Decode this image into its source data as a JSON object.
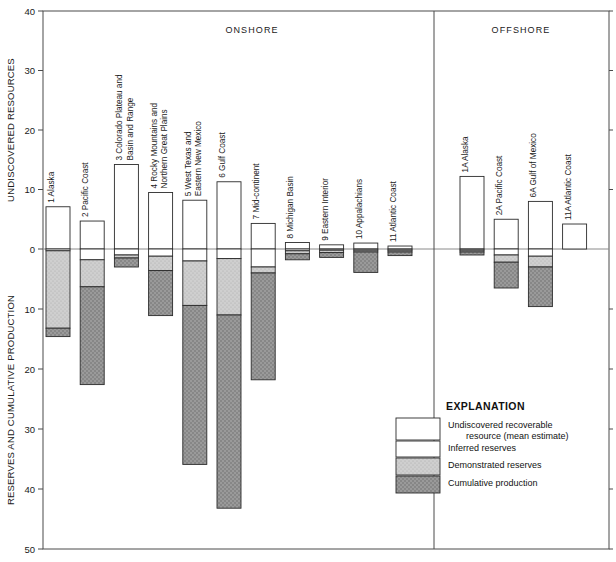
{
  "chart_data": {
    "type": "bar",
    "title": "",
    "ylabel_top": "UNDISCOVERED RESOURCES",
    "ylabel_bottom": "RESERVES AND CUMULATIVE PRODUCTION",
    "xlabel": "",
    "ylim": [
      -50,
      40
    ],
    "yticks_top": [
      40,
      30,
      20,
      10,
      0
    ],
    "yticks_bottom": [
      0,
      10,
      20,
      30,
      40,
      50
    ],
    "grid": false,
    "legend_position": "inside-lower-right",
    "group_labels": [
      "ONSHORE",
      "OFFSHORE"
    ],
    "series": [
      {
        "name": "Undiscovered recoverable resource (mean estimate)",
        "key": "undiscovered",
        "color": "#ffffff"
      },
      {
        "name": "Inferred reserves",
        "key": "inferred",
        "color": "#fdfdfd"
      },
      {
        "name": "Demonstrated reserves",
        "key": "demonstrated",
        "color": "#c8c8c8"
      },
      {
        "name": "Cumulative production",
        "key": "cumulative",
        "color": "#8f8f8f"
      }
    ],
    "categories": [
      {
        "id": "1",
        "label": "1 Alaska",
        "group": "ONSHORE",
        "undiscovered": 7.1,
        "inferred": 0.3,
        "demonstrated": 13.2,
        "cumulative": 14.6
      },
      {
        "id": "2",
        "label": "2 Pacific Coast",
        "group": "ONSHORE",
        "undiscovered": 4.7,
        "inferred": 1.8,
        "demonstrated": 6.3,
        "cumulative": 22.6
      },
      {
        "id": "3",
        "label": "3 Colorado Plateau and\nBasin and Range",
        "group": "ONSHORE",
        "undiscovered": 14.2,
        "inferred": 1.0,
        "demonstrated": 1.5,
        "cumulative": 3.0
      },
      {
        "id": "4",
        "label": "4 Rocky Mountains and\nNorthern Great Plains",
        "group": "ONSHORE",
        "undiscovered": 9.5,
        "inferred": 1.2,
        "demonstrated": 3.6,
        "cumulative": 11.1
      },
      {
        "id": "5",
        "label": "5 West Texas and\nEastern New Mexico",
        "group": "ONSHORE",
        "undiscovered": 8.2,
        "inferred": 2.0,
        "demonstrated": 9.4,
        "cumulative": 35.9
      },
      {
        "id": "6",
        "label": "6 Gulf Coast",
        "group": "ONSHORE",
        "undiscovered": 11.3,
        "inferred": 1.6,
        "demonstrated": 11.0,
        "cumulative": 43.2
      },
      {
        "id": "7",
        "label": "7 Mid-continent",
        "group": "ONSHORE",
        "undiscovered": 4.3,
        "inferred": 3.0,
        "demonstrated": 4.0,
        "cumulative": 21.8
      },
      {
        "id": "8",
        "label": "8 Michigan Basin",
        "group": "ONSHORE",
        "undiscovered": 1.1,
        "inferred": 0.3,
        "demonstrated": 0.8,
        "cumulative": 1.8
      },
      {
        "id": "9",
        "label": "9 Eastern Interior",
        "group": "ONSHORE",
        "undiscovered": 0.7,
        "inferred": 0.2,
        "demonstrated": 0.6,
        "cumulative": 1.4
      },
      {
        "id": "10",
        "label": "10 Appalachians",
        "group": "ONSHORE",
        "undiscovered": 1.0,
        "inferred": 0.2,
        "demonstrated": 0.5,
        "cumulative": 3.9
      },
      {
        "id": "11",
        "label": "11 Atlantic Coast",
        "group": "ONSHORE",
        "undiscovered": 0.5,
        "inferred": 0.2,
        "demonstrated": 0.5,
        "cumulative": 1.1
      },
      {
        "id": "1A",
        "label": "1A Alaska",
        "group": "OFFSHORE",
        "undiscovered": 12.2,
        "inferred": 0.2,
        "demonstrated": 0.5,
        "cumulative": 1.0
      },
      {
        "id": "2A",
        "label": "2A Pacific Coast",
        "group": "OFFSHORE",
        "undiscovered": 5.0,
        "inferred": 1.0,
        "demonstrated": 2.2,
        "cumulative": 6.5
      },
      {
        "id": "6A",
        "label": "6A Gulf of Mexico",
        "group": "OFFSHORE",
        "undiscovered": 8.0,
        "inferred": 1.2,
        "demonstrated": 3.0,
        "cumulative": 9.6
      },
      {
        "id": "11A",
        "label": "11A Atlantic Coast",
        "group": "OFFSHORE",
        "undiscovered": 4.2,
        "inferred": 0.0,
        "demonstrated": 0.0,
        "cumulative": 0.0
      }
    ]
  },
  "legend": {
    "title": "EXPLANATION",
    "items": [
      {
        "label_line1": "Undiscovered recoverable",
        "label_line2": "resource (mean estimate)",
        "fill": "white"
      },
      {
        "label_line1": "Inferred reserves",
        "label_line2": "",
        "fill": "white"
      },
      {
        "label_line1": "Demonstrated reserves",
        "label_line2": "",
        "fill": "lightgray"
      },
      {
        "label_line1": "Cumulative production",
        "label_line2": "",
        "fill": "darkgray"
      }
    ]
  },
  "colors": {
    "undiscovered": "#ffffff",
    "inferred": "#ffffff",
    "demonstrated": "#c9c9c9",
    "cumulative": "#8c8c8c",
    "outline": "#2b2b2b",
    "axis": "#4a4a4a",
    "background": "#ffffff"
  }
}
